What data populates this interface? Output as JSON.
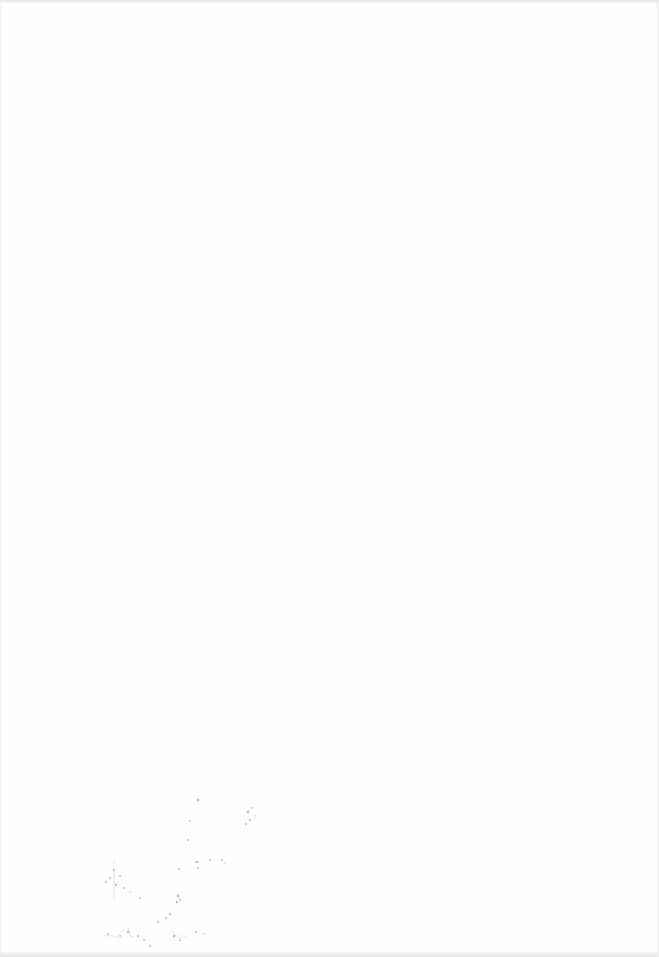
{
  "document": {
    "type": "blank scanned page",
    "text": "",
    "background_color": "#fefefe",
    "has_legible_content": false
  },
  "artifacts": {
    "scan_marks": {
      "description": "faint illegible bleed-through speckles",
      "region": "bottom-left",
      "color": "#9a9a9a"
    }
  }
}
